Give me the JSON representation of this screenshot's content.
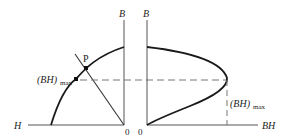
{
  "figure": {
    "left_panel": {
      "y_axis_label": "B",
      "x_axis_label": "H",
      "origin_label": "0",
      "point_label": "P",
      "bhmax_label_main": "(BH)",
      "bhmax_label_sub": "max"
    },
    "right_panel": {
      "y_axis_label": "B",
      "x_axis_label": "BH",
      "origin_label": "0",
      "bhmax_label_main": "(BH)",
      "bhmax_label_sub": "max"
    },
    "colors": {
      "line": "#1a1a1a",
      "axis": "#555555",
      "dash": "#777777"
    }
  }
}
